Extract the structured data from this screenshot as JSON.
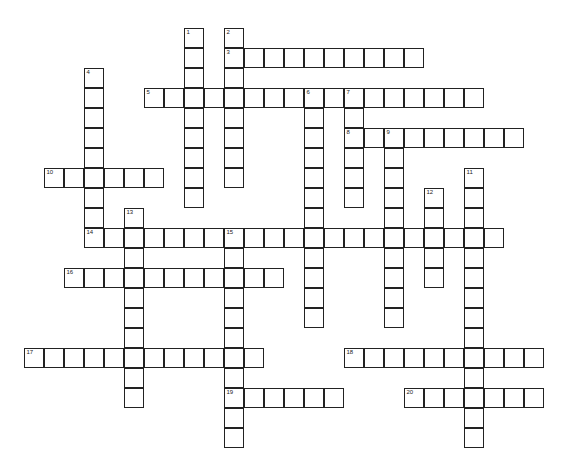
{
  "puzzle": {
    "type": "crossword",
    "cell_size": 20,
    "origin": {
      "x": 24,
      "y": 28
    },
    "words": [
      {
        "number": "1",
        "direction": "down",
        "col": 8,
        "row": 0,
        "length": 9
      },
      {
        "number": "2",
        "direction": "down",
        "col": 10,
        "row": 0,
        "length": 8
      },
      {
        "number": "3",
        "direction": "across",
        "col": 10,
        "row": 1,
        "length": 10
      },
      {
        "number": "4",
        "direction": "down",
        "col": 3,
        "row": 2,
        "length": 9
      },
      {
        "number": "5",
        "direction": "across",
        "col": 6,
        "row": 3,
        "length": 17
      },
      {
        "number": "6",
        "direction": "down",
        "col": 14,
        "row": 3,
        "length": 12
      },
      {
        "number": "7",
        "direction": "down",
        "col": 16,
        "row": 3,
        "length": 6
      },
      {
        "number": "8",
        "direction": "across",
        "col": 16,
        "row": 5,
        "length": 9
      },
      {
        "number": "9",
        "direction": "down",
        "col": 18,
        "row": 5,
        "length": 10
      },
      {
        "number": "10",
        "direction": "across",
        "col": 1,
        "row": 7,
        "length": 6
      },
      {
        "number": "11",
        "direction": "down",
        "col": 22,
        "row": 7,
        "length": 14
      },
      {
        "number": "12",
        "direction": "down",
        "col": 20,
        "row": 8,
        "length": 5
      },
      {
        "number": "13",
        "direction": "down",
        "col": 5,
        "row": 9,
        "length": 10
      },
      {
        "number": "14",
        "direction": "across",
        "col": 3,
        "row": 10,
        "length": 21
      },
      {
        "number": "15",
        "direction": "down",
        "col": 10,
        "row": 10,
        "length": 11
      },
      {
        "number": "16",
        "direction": "across",
        "col": 2,
        "row": 12,
        "length": 11
      },
      {
        "number": "17",
        "direction": "across",
        "col": 0,
        "row": 16,
        "length": 12
      },
      {
        "number": "18",
        "direction": "across",
        "col": 16,
        "row": 16,
        "length": 10
      },
      {
        "number": "19",
        "direction": "across",
        "col": 10,
        "row": 18,
        "length": 6
      },
      {
        "number": "20",
        "direction": "across",
        "col": 19,
        "row": 18,
        "length": 7
      }
    ]
  }
}
